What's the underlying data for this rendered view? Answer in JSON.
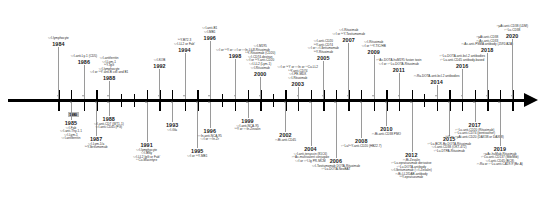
{
  "figure": {
    "type": "timeline",
    "orientation": "horizontal",
    "axis_start_label": "1980",
    "axis_range": [
      "1980",
      "2020"
    ],
    "arrow_direction": "right",
    "tick_interval_years": 1
  },
  "nodes": [
    {
      "year": "1984",
      "side": "above",
      "entries": [
        "¹³¹I-lymphocyte"
      ]
    },
    {
      "year": "1986",
      "side": "above",
      "entries": [
        "¹³¹I-anti-Ly-1 (CD5)"
      ]
    },
    {
      "year": "1988",
      "side": "above",
      "entries": [
        "¹³¹I-antiferritin",
        "¹³¹I-Lym-1",
        "⁹⁰Y-IgG",
        "¹³¹I-lymphocyte",
        "¹³¹I or ⁹⁰Y anti-B cell and B1"
      ]
    },
    {
      "year": "1992",
      "side": "above",
      "entries": [
        "¹³¹I-KOB"
      ]
    },
    {
      "year": "1994",
      "side": "above",
      "entries": [
        "⁹⁰Y-B72.3",
        "¹³¹I-LL2 or Fab′"
      ]
    },
    {
      "year": "1996",
      "side": "above",
      "entries": [
        "¹³¹I-anti-B1",
        "¹³¹I-MB1"
      ]
    },
    {
      "year": "1998",
      "side": "above",
      "entries": [
        "¹³¹I or ⁹⁰Y or ¹³¹I or ¹¹¹In-LL2"
      ]
    },
    {
      "year": "2000",
      "side": "above",
      "entries": [
        "¹³¹I-M195",
        "¹³¹I-Rituximab",
        "⁹⁰Y-Rituximab (CD20)",
        "¹³¹I-CD74-dextran",
        "¹³¹I or ⁹⁰Y-anti-CD20",
        "¹³¹I-LL2 (Lym-1)",
        "¹³¹I-Rituximab"
      ]
    },
    {
      "year": "2003",
      "side": "above",
      "entries": [
        "¹³¹I or ⁹⁰Y or ¹¹¹In or ⁶⁷Cu-LL2",
        "⁹⁰Y-anti-CD74",
        "¹³¹I-PE-MDX",
        "¹³¹I-Rituximab"
      ]
    },
    {
      "year": "2005",
      "side": "above",
      "entries": [
        "¹³¹I-anti-CD20",
        "⁹⁰Y-anti-CD74",
        "¹³¹I or ¹³¹I-Ibritumomab",
        "⁹⁰Y-Rituximab"
      ]
    },
    {
      "year": "2007",
      "side": "above",
      "entries": [
        "¹³¹I-Rituximab",
        "¹³¹I or ⁹⁰Y-Tositumomab"
      ]
    },
    {
      "year": "2009",
      "side": "above",
      "entries": [
        "¹³¹I-Rituximab",
        "¹³¹I or ⁹⁰Y-TIC/HB"
      ]
    },
    {
      "year": "2011",
      "side": "above",
      "entries": [
        "²²⁵Ac-DOTA-huM195 fusion toxin",
        "¹³¹I or ¹⁷⁷Lu-DOTA-Rituximab"
      ]
    },
    {
      "year": "2014",
      "side": "above",
      "entries": [
        "²²³Ra-DOTA-anti-bcl-2 antibodies"
      ]
    },
    {
      "year": "2016",
      "side": "above",
      "entries": [
        "¹⁷⁷Lu-DOTA-anti-bcl-2 antibodies",
        "¹⁷⁷Lu-anti-CD45 antibody-based"
      ]
    },
    {
      "year": "2018",
      "side": "above",
      "entries": [
        "²²µAt-anti-CD38",
        "²²³Ac-anti-CD33",
        "²²³Ac-anti-PSMA antibody (J591/A2A)"
      ]
    },
    {
      "year": "2020",
      "side": "above",
      "entries": [
        "²²µAt-anti-CD38 (LDM)",
        "¹⁷⁷Lu-CD38"
      ]
    },
    {
      "year": "1985",
      "side": "below",
      "entries": [
        "¹³¹I-Fab",
        "¹³¹I-anti-Thy-1.1",
        "¹³¹I-Lym-1",
        "¹³¹I-antiferritin"
      ]
    },
    {
      "year": "1987",
      "side": "below",
      "entries": [
        "¹³¹I-Lym-1/a",
        "⁹⁰Y-Ibritumomab"
      ]
    },
    {
      "year": "1988",
      "side": "below",
      "entries": [
        "¹³¹I-anti-CD7 (WT1-1)",
        "¹³¹I-anti-CD45 (PG)"
      ]
    },
    {
      "year": "1991",
      "side": "below",
      "entries": [
        "¹³¹I-lymphocyte",
        "¹³¹I-BNy",
        "¹³¹I-LL2 IgG or Fab′",
        "⁶⁷Cu-Macintyre"
      ]
    },
    {
      "year": "1993",
      "side": "below",
      "entries": [
        "¹³¹I-Gla"
      ]
    },
    {
      "year": "1995",
      "side": "below",
      "entries": [
        "¹³¹I or ⁹⁰Y-MB1"
      ]
    },
    {
      "year": "1996",
      "side": "below",
      "entries": [
        "¹¹¹In-anti-NCA-95",
        "¹³¹I or ¹¹¹In-Zr"
      ]
    },
    {
      "year": "1999",
      "side": "below",
      "entries": [
        "¹³¹I-anti-NCA-95",
        "⁹⁰Y or ¹¹¹In-Zevalin"
      ]
    },
    {
      "year": "2002",
      "side": "below",
      "entries": [
        "²²³Bi-anti-CD45"
      ]
    },
    {
      "year": "2004",
      "side": "below",
      "entries": [
        "¹³¹I-anti-tenascin (81C6)",
        "²²⁵Ac-multivalent conjugate",
        "¹³¹I or ¹²⁵I-Ig PR-MCM"
      ]
    },
    {
      "year": "2006",
      "side": "below",
      "entries": [
        "¹³¹I-Tositumomab DOTA-Rituximab",
        "¹⁷⁷Lu-DOTA-NeoBAT"
      ]
    },
    {
      "year": "2008",
      "side": "below",
      "entries": [
        "¹⁷⁷Lu/⁹⁰Y-anti-CD20 (HB22.7)"
      ]
    },
    {
      "year": "2010",
      "side": "below",
      "entries": [
        "²²³Bi-anti-CD38 PMO"
      ]
    },
    {
      "year": "2012",
      "side": "below",
      "entries": [
        "²²³Bi-Zevalin",
        "¹⁷⁷Lu-epratuzumab derivative",
        "¹⁷⁷Lu-DOTA-antibody",
        "¹³¹I-Ibritumomab (¹³¹I-Zevalin)",
        "²²³Bi-LL2/DAB-antibody",
        "⁹⁰Y-epratuzumab"
      ]
    },
    {
      "year": "2015",
      "side": "below",
      "entries": [
        "¹⁷⁷Lu-BCR-Bz-DOTA-Rituximab",
        "¹³¹I-anti-CD38 (OKT-472)",
        "¹⁷⁷Lu-DTPA-Rituximab"
      ]
    },
    {
      "year": "2017",
      "side": "below",
      "entries": [
        "¹⁷⁷Lu-anti-CD20 (Rituximab)",
        "¹⁷⁷Lu-anti-CD74 (pentixather)",
        "⁹⁰Y or ²²µAt-anti-CD20 (DAX38 or DAX88)"
      ]
    },
    {
      "year": "2019",
      "side": "below",
      "entries": [
        "²²µAc-huMab-Rituximab",
        "¹⁷⁷Lu-anti-CD137 (Mib/Mib)",
        "¹³¹I-anti-CD45 (BC8)",
        "²²³Ra or ¹⁷⁷Lu-anti-CA19-9 (Bz-A)"
      ]
    }
  ]
}
